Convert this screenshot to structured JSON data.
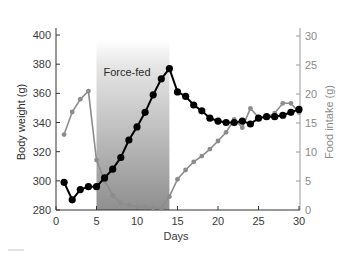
{
  "chart_data": {
    "type": "line",
    "title": "",
    "xlabel": "Days",
    "ylabel": "Body weight (g)",
    "y2label": "Food intake (g)",
    "xlim": [
      0,
      30
    ],
    "ylim": [
      280,
      410
    ],
    "y2lim": [
      0,
      32
    ],
    "xticks": [
      0,
      5,
      10,
      15,
      20,
      25,
      30
    ],
    "yticks": [
      280,
      300,
      320,
      340,
      360,
      380,
      400
    ],
    "y2ticks": [
      0,
      5,
      10,
      15,
      20,
      25,
      30
    ],
    "grid": false,
    "annotations": [
      {
        "type": "shaded_region",
        "x_start": 5,
        "x_end": 14,
        "label": "Force-fed"
      }
    ],
    "series": [
      {
        "name": "Body weight (g)",
        "axis": "left",
        "color": "#000000",
        "x": [
          1,
          2,
          3,
          4,
          5,
          6,
          7,
          8,
          9,
          10,
          11,
          12,
          13,
          14,
          15,
          16,
          17,
          18,
          19,
          20,
          21,
          22,
          23,
          24,
          25,
          26,
          27,
          28,
          29,
          30
        ],
        "values": [
          299,
          287,
          294,
          296,
          296,
          302,
          308,
          316,
          328,
          337,
          347,
          359,
          370,
          377,
          361,
          358,
          352,
          348,
          343,
          341,
          340,
          340,
          341,
          339,
          343,
          344,
          344,
          345,
          347,
          349
        ]
      },
      {
        "name": "Food intake (g)",
        "axis": "right",
        "color": "#8c8c8c",
        "x": [
          1,
          2,
          3,
          4,
          5,
          6,
          7,
          8,
          9,
          10,
          11,
          12,
          13,
          14,
          15,
          16,
          17,
          18,
          19,
          20,
          21,
          22,
          23,
          24,
          25,
          26,
          27,
          28,
          29,
          30
        ],
        "values": [
          13.0,
          16.9,
          19.1,
          20.5,
          8.6,
          5.0,
          2.5,
          1.2,
          0.8,
          0.5,
          0.5,
          0.4,
          0.3,
          2.3,
          5.3,
          6.9,
          8.3,
          9.3,
          10.5,
          11.9,
          13.4,
          15.6,
          14.2,
          17.5,
          16.0,
          16.0,
          16.7,
          18.4,
          18.4,
          16.8
        ]
      }
    ]
  },
  "colors": {
    "body_weight": "#000000",
    "food_intake": "#8c8c8c",
    "shade_top": "#ffffff",
    "shade_bottom": "#8f8f8f"
  }
}
